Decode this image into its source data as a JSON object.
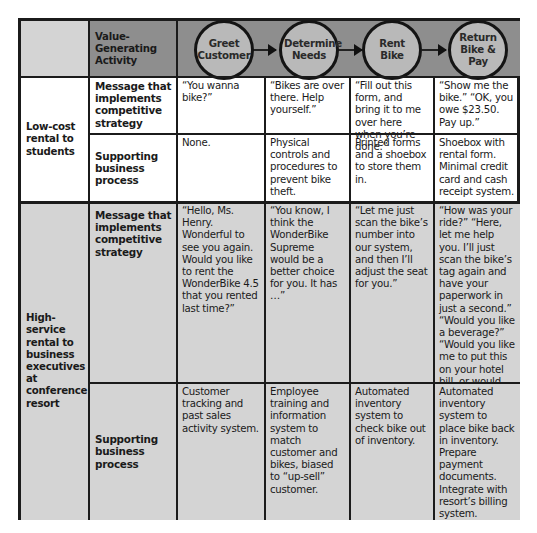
{
  "header": {
    "row_label": "Value-Generating Activity",
    "activities": [
      {
        "label": "Greet Customer"
      },
      {
        "label": "Determine Needs"
      },
      {
        "label": "Rent Bike"
      },
      {
        "label": "Return Bike & Pay"
      }
    ]
  },
  "segments": [
    {
      "name": "Low-cost rental to students",
      "rows": [
        {
          "label": "Message that implements competitive strategy",
          "cells": [
            "“You wanna bike?”",
            "“Bikes are over there. Help yourself.”",
            "“Fill out this form, and bring it to me over here when you’re done.”",
            "“Show me the bike.” “OK, you owe $23.50. Pay up.”"
          ]
        },
        {
          "label": "Supporting business process",
          "cells": [
            "None.",
            "Physical controls and procedures to prevent bike theft.",
            "Printed forms and a shoebox to store them in.",
            "Shoebox with rental form. Minimal credit card and cash receipt system."
          ]
        }
      ]
    },
    {
      "name": "High-service rental to business executives at conference resort",
      "rows": [
        {
          "label": "Message that implements competitive strategy",
          "cells": [
            "“Hello, Ms. Henry. Wonderful to see you again. Would you like to rent the WonderBike 4.5 that you rented last time?”",
            "“You know, I think the WonderBike Supreme would be a better choice for you. It has …”",
            "“Let me just scan the bike’s number into our system, and then I’ll adjust the seat for you.”",
            "“How was your ride?” “Here, let me help you. I’ll just scan the bike’s tag again and have your paperwork in just a second.” “Would you like a beverage?” “Would you like me to put this on your hotel bill, or would you prefer to pay now?”"
          ]
        },
        {
          "label": "Supporting business process",
          "cells": [
            "Customer tracking and past sales activity system.",
            "Employee training and information system to match customer and bikes, biased to “up-sell” customer.",
            "Automated inventory system to check bike out of inventory.",
            "Automated inventory system to place bike back in inventory. Prepare payment documents. Integrate with resort’s billing system."
          ]
        }
      ]
    }
  ],
  "colors": {
    "header_band": "#8e8e8e",
    "circle_fill": "#b9b9b9",
    "high_service_fill": "#d4d4d4",
    "low_cost_fill": "#ffffff",
    "border": "#1b1b1b"
  }
}
